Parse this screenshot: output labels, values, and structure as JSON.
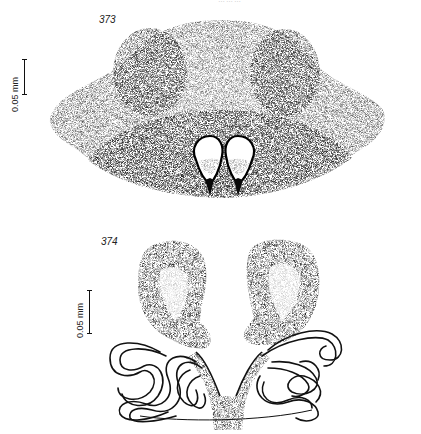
{
  "page": {
    "running_header": "………"
  },
  "figures": [
    {
      "number": "373",
      "scale_label": "0.05 mm",
      "description": "Epigynum, ventral view (stippled)"
    },
    {
      "number": "374",
      "scale_label": "0.05 mm",
      "description": "Vulva, dorsal view (spermathecae with coiled ducts)"
    }
  ]
}
